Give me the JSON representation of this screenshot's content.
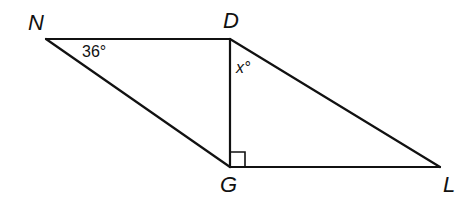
{
  "figure": {
    "type": "parallelogram with diagonal",
    "vertices": {
      "N": {
        "label": "N",
        "x": 46,
        "y": 39
      },
      "D": {
        "label": "D",
        "x": 230,
        "y": 39
      },
      "G": {
        "label": "G",
        "x": 230,
        "y": 167
      },
      "L": {
        "label": "L",
        "x": 440,
        "y": 167
      }
    },
    "segments": [
      {
        "name": "ND",
        "from": "N",
        "to": "D"
      },
      {
        "name": "DL",
        "from": "D",
        "to": "L"
      },
      {
        "name": "LG",
        "from": "L",
        "to": "G"
      },
      {
        "name": "GN",
        "from": "G",
        "to": "N"
      },
      {
        "name": "DG",
        "from": "D",
        "to": "G"
      }
    ],
    "angles": {
      "N": {
        "text": "36°"
      },
      "D": {
        "text": "x°"
      }
    },
    "right_angle_at": "G",
    "stroke_color": "#111111"
  }
}
